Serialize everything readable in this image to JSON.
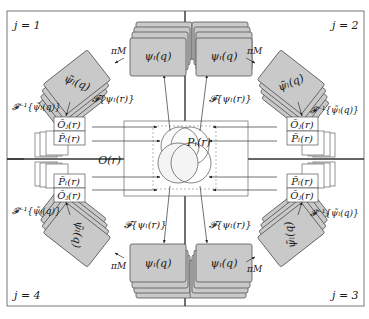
{
  "diagram": {
    "center": {
      "object_label": "O(r)",
      "probe_label": "P_l(r)",
      "probe_label_text": "Pₗ(r)",
      "object_label_text": "O(r)"
    },
    "quadrants": [
      {
        "id": "j1",
        "label": "j = 1",
        "stack_label": "ψₗ(q)",
        "tilted_stack_label": "ψ̃ₗ(q)",
        "projection_label": "π_M",
        "projection_label_text": "πM",
        "forward_label": "𝓕{ψₗ(r)}",
        "inverse_label": "𝓕⁻¹{ψ̃ₗ(q)}",
        "object_update": "Ōⱼ(r)",
        "probe_update": "P̄ₗ(r)"
      },
      {
        "id": "j2",
        "label": "j = 2",
        "stack_label": "ψₗ(q)",
        "tilted_stack_label": "ψ̃ₗ(q)",
        "projection_label_text": "πM",
        "forward_label": "𝓕{ψₗ(r)}",
        "inverse_label": "𝓕⁻¹{ψ̃ₗ(q)}",
        "object_update": "Ōⱼ(r)",
        "probe_update": "P̄ₗ(r)"
      },
      {
        "id": "j3",
        "label": "j = 3",
        "stack_label": "ψₗ(q)",
        "tilted_stack_label": "ψ̃ₗ(q)",
        "projection_label_text": "πM",
        "forward_label": "𝓕{ψₗ(r)}",
        "inverse_label": "𝓕⁻¹{ψ̃ₗ(q)}",
        "object_update": "Ōⱼ(r)",
        "probe_update": "P̄ₗ(r)"
      },
      {
        "id": "j4",
        "label": "j = 4",
        "stack_label": "ψₗ(q)",
        "tilted_stack_label": "ψ̃ₗ(q)",
        "projection_label_text": "πM",
        "forward_label": "𝓕{ψₗ(r)}",
        "inverse_label": "𝓕⁻¹{ψ̃ₗ(q)}",
        "object_update": "Ōⱼ(r)",
        "probe_update": "P̄ₗ(r)"
      }
    ],
    "colors": {
      "card_fill": "#c8c8c8",
      "card_stroke": "#555555",
      "line": "#333333",
      "panel_border": "#555555",
      "circle_stroke": "#555555"
    }
  }
}
